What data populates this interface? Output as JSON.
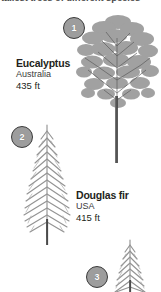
{
  "heading": {
    "text": "tallest trees of different species",
    "note": "clipped at top edge"
  },
  "trees": [
    {
      "marker": "1",
      "name": "Eucalyptus",
      "country": "Australia",
      "height": "435 ft",
      "icon": "broadleaf-tree-icon"
    },
    {
      "marker": "2",
      "name": "Douglas fir",
      "country": "USA",
      "height": "415 ft",
      "icon": "conifer-tree-icon"
    },
    {
      "marker": "3",
      "name": "",
      "country": "",
      "height": "",
      "icon": "conifer-tree-icon"
    }
  ],
  "colors": {
    "background": "#ffffff",
    "text": "#231f20",
    "badge_fill": "#9d9d9d",
    "badge_ring": "#3b3b3b",
    "foliage": "#9a9a9a",
    "trunk": "#4a4a4a"
  }
}
